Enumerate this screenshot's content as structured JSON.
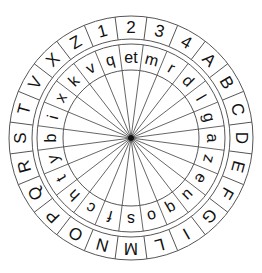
{
  "diagram": {
    "center": [
      131,
      138
    ],
    "segments": 24,
    "start_angle_deg": -7.5,
    "outer_ring": {
      "label": "outer-alphabet-ring",
      "r_inner": 99,
      "r_outer": 122,
      "letters": [
        "2",
        "3",
        "4",
        "A",
        "B",
        "C",
        "D",
        "E",
        "F",
        "G",
        "I",
        "L",
        "M",
        "N",
        "O",
        "P",
        "Q",
        "R",
        "S",
        "T",
        "V",
        "X",
        "Z",
        "1"
      ]
    },
    "inner_ring": {
      "label": "inner-alphabet-ring",
      "r_inner": 68,
      "r_outer": 94,
      "letters": [
        "et",
        "m",
        "r",
        "d",
        "l",
        "g",
        "a",
        "z",
        "e",
        "u",
        "q",
        "o",
        "s",
        "f",
        "c",
        "h",
        "t",
        "y",
        "b",
        "i",
        "x",
        "k",
        "v",
        "q"
      ]
    },
    "spokes": {
      "count": 24,
      "r_outer": 94
    },
    "colors": {
      "line": "#555555",
      "text": "#111111",
      "background": "#ffffff"
    }
  }
}
